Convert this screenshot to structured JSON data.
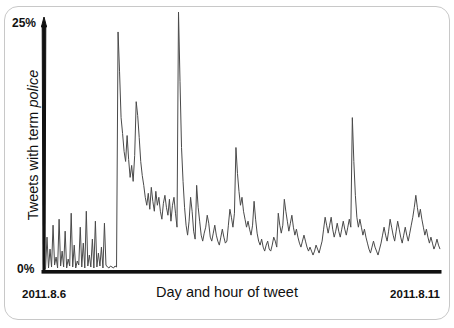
{
  "figure": {
    "background_color": "#ffffff",
    "border_color": "#c8c8c8",
    "axis_color": "#111111",
    "line_color": "#4a4a4a"
  },
  "axis": {
    "y_top_tick": "25%",
    "y_bottom_tick": "0%",
    "y_label_prefix": "Tweets with term ",
    "y_label_term": "police",
    "x_label": "Day and hour of tweet",
    "x_tick_start": "2011.8.6",
    "x_tick_end": "2011.8.11"
  },
  "chart_data": {
    "type": "line",
    "title": "",
    "xlabel": "Day and hour of tweet",
    "ylabel": "Tweets with term police",
    "ylim": [
      0,
      25
    ],
    "ytick_labels": [
      "0%",
      "25%"
    ],
    "xlim_labels": [
      "2011.8.6",
      "2011.8.11"
    ],
    "grid": false,
    "legend": null,
    "series_name": "Tweets with term police",
    "x_unit": "hour",
    "y_unit": "percent",
    "values": [
      0.2,
      3.4,
      0.3,
      2.2,
      0.4,
      4.6,
      0.6,
      1.4,
      0.3,
      5.2,
      0.5,
      2.0,
      0.4,
      4.0,
      0.3,
      1.2,
      0.5,
      5.8,
      0.4,
      2.6,
      0.3,
      1.0,
      0.6,
      4.4,
      0.4,
      2.8,
      0.3,
      6.0,
      0.5,
      1.6,
      0.4,
      3.2,
      0.3,
      5.0,
      0.4,
      1.8,
      0.5,
      2.4,
      0.3,
      4.8,
      0.6,
      0.4,
      0.3,
      0.5,
      0.4,
      0.3,
      0.5,
      0.4,
      24.0,
      20.0,
      15.4,
      13.8,
      12.0,
      11.0,
      13.6,
      11.2,
      9.4,
      10.6,
      9.0,
      11.6,
      17.0,
      15.6,
      13.4,
      11.0,
      9.6,
      8.6,
      7.4,
      6.6,
      7.8,
      6.2,
      8.4,
      7.0,
      6.0,
      8.0,
      6.6,
      7.4,
      6.0,
      5.2,
      6.8,
      7.6,
      6.4,
      5.6,
      7.2,
      5.0,
      6.6,
      7.4,
      5.8,
      4.4,
      26.0,
      19.0,
      12.4,
      9.0,
      6.4,
      4.6,
      3.6,
      5.0,
      7.4,
      6.0,
      4.0,
      3.2,
      8.6,
      6.4,
      5.0,
      3.6,
      3.0,
      3.8,
      4.4,
      5.6,
      4.8,
      3.4,
      3.0,
      3.8,
      4.6,
      3.6,
      3.0,
      2.6,
      3.4,
      4.2,
      3.4,
      2.8,
      3.0,
      4.6,
      6.2,
      5.4,
      4.4,
      5.8,
      12.4,
      9.8,
      8.0,
      6.6,
      7.4,
      6.0,
      5.2,
      4.4,
      5.0,
      4.2,
      3.6,
      4.6,
      7.0,
      5.2,
      3.8,
      3.0,
      2.6,
      3.2,
      2.4,
      2.0,
      2.6,
      3.0,
      2.2,
      2.0,
      2.6,
      3.4,
      3.0,
      2.4,
      5.8,
      4.6,
      3.8,
      4.6,
      7.2,
      6.0,
      5.0,
      4.0,
      4.8,
      5.6,
      4.4,
      3.6,
      4.2,
      3.4,
      2.8,
      2.4,
      3.0,
      3.6,
      3.0,
      2.4,
      2.0,
      2.4,
      2.0,
      1.6,
      2.0,
      2.6,
      2.2,
      1.8,
      2.4,
      3.0,
      4.2,
      5.4,
      4.6,
      3.8,
      4.6,
      5.4,
      4.2,
      3.4,
      4.0,
      4.8,
      4.0,
      3.4,
      4.2,
      5.0,
      4.2,
      3.6,
      4.4,
      5.2,
      4.4,
      15.4,
      11.0,
      7.6,
      5.4,
      4.4,
      5.2,
      4.4,
      3.6,
      4.2,
      3.4,
      2.8,
      2.2,
      1.8,
      2.4,
      3.0,
      2.4,
      2.0,
      1.6,
      2.2,
      2.8,
      3.6,
      4.4,
      3.6,
      3.0,
      4.0,
      5.2,
      4.4,
      3.6,
      3.0,
      4.0,
      5.0,
      4.2,
      3.4,
      2.8,
      3.6,
      4.4,
      3.6,
      3.0,
      3.8,
      4.6,
      5.4,
      6.4,
      7.6,
      6.4,
      5.4,
      6.2,
      5.2,
      4.4,
      3.6,
      4.2,
      3.4,
      2.8,
      3.4,
      2.8,
      2.2,
      2.6,
      3.2,
      2.6,
      2.2
    ]
  }
}
